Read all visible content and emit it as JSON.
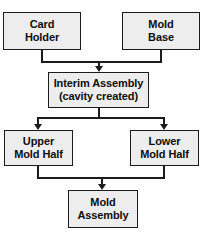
{
  "page": {
    "background_color": "#ffffff",
    "top_clipped_text": "",
    "node_fill_color": "#ededed",
    "node_border_color": "#1c1c1c",
    "connector_color": "#1c1c1c"
  },
  "diagram": {
    "type": "flowchart",
    "title": "",
    "nodes": [
      {
        "id": "card-holder",
        "line1": "Card",
        "line2": "Holder"
      },
      {
        "id": "mold-base",
        "line1": "Mold",
        "line2": "Base"
      },
      {
        "id": "interim",
        "line1": "Interim Assembly",
        "line2": "(cavity created)"
      },
      {
        "id": "upper-half",
        "line1": "Upper",
        "line2": "Mold Half"
      },
      {
        "id": "lower-half",
        "line1": "Lower",
        "line2": "Mold Half"
      },
      {
        "id": "mold-assembly",
        "line1": "Mold",
        "line2": "Assembly"
      }
    ],
    "edges": [
      {
        "from": "card-holder",
        "to": "interim"
      },
      {
        "from": "mold-base",
        "to": "interim"
      },
      {
        "from": "interim",
        "to": "upper-half"
      },
      {
        "from": "interim",
        "to": "lower-half"
      },
      {
        "from": "upper-half",
        "to": "mold-assembly"
      },
      {
        "from": "lower-half",
        "to": "mold-assembly"
      }
    ]
  }
}
